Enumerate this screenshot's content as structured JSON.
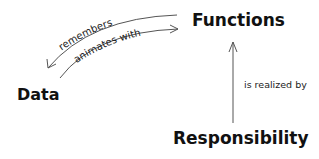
{
  "diagram": {
    "nodes": {
      "functions": "Functions",
      "data": "Data",
      "responsibility": "Responsibility"
    },
    "edges": {
      "remembers": "remembers",
      "animates_with": "animates with",
      "is_realized_by": "is realized by"
    },
    "colors": {
      "text": "#111111",
      "line": "#555555",
      "background": "#ffffff"
    }
  }
}
